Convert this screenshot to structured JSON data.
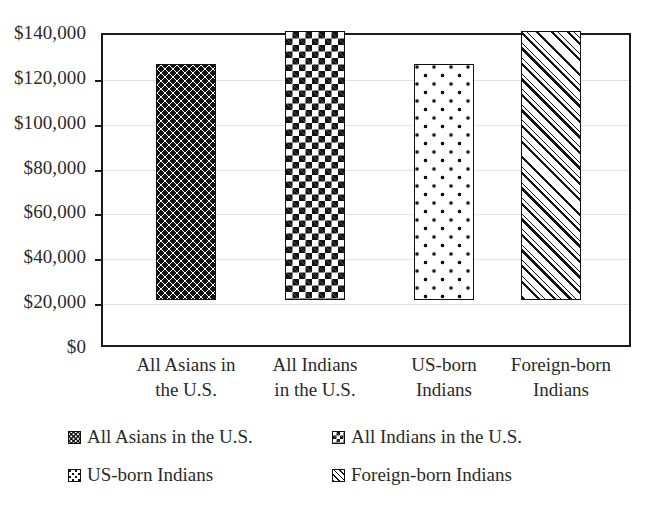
{
  "chart_data": {
    "type": "bar",
    "title": "",
    "subtitle": "",
    "xlabel": "",
    "ylabel": "",
    "categories": [
      "All Asians in the U.S.",
      "All Indians in the U.S.",
      "US-born Indians",
      "Foreign-born Indians"
    ],
    "category_lines": [
      [
        "All Asians in",
        "the U.S."
      ],
      [
        "All Indians",
        "in the U.S."
      ],
      [
        "US-born",
        "Indians"
      ],
      [
        "Foreign-born",
        "Indians"
      ]
    ],
    "values": [
      85000,
      119000,
      105000,
      120000
    ],
    "ylim": [
      0,
      140000
    ],
    "ytick_values": [
      0,
      20000,
      40000,
      60000,
      80000,
      100000,
      120000,
      140000
    ],
    "ytick_labels": [
      "$0",
      "$20,000",
      "$40,000",
      "$60,000",
      "$80,000",
      "$100,000",
      "$120,000",
      "$140,000"
    ],
    "grid": true,
    "legend_position": "bottom",
    "series": [
      {
        "name": "All Asians in the U.S.",
        "value": 85000,
        "pattern": "square-dot-grid"
      },
      {
        "name": "All Indians in the U.S.",
        "value": 119000,
        "pattern": "dense-checker"
      },
      {
        "name": "US-born Indians",
        "value": 105000,
        "pattern": "sparse-round-dots"
      },
      {
        "name": "Foreign-born Indians",
        "value": 120000,
        "pattern": "diagonal-hatch"
      }
    ]
  },
  "axis": {
    "y_labels": [
      "$140,000",
      "$120,000",
      "$100,000",
      "$80,000",
      "$60,000",
      "$40,000",
      "$20,000",
      "$0"
    ]
  },
  "legend": {
    "items": [
      {
        "label": "All Asians in the U.S.",
        "swatch": "square-dot-grid-swatch"
      },
      {
        "label": "All Indians in the U.S.",
        "swatch": "dense-checker-swatch"
      },
      {
        "label": "US-born Indians",
        "swatch": "sparse-round-dots-swatch"
      },
      {
        "label": "Foreign-born Indians",
        "swatch": "diagonal-hatch-swatch"
      }
    ]
  },
  "colors": {
    "ink": "#141414",
    "axis": "#1b1b1b",
    "grid": "#e2e2e2",
    "background": "#ffffff",
    "text": "#2a2a2a"
  }
}
